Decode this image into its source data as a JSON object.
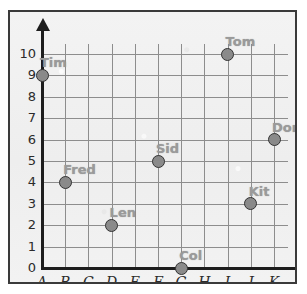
{
  "chart_data": {
    "type": "scatter",
    "title": "",
    "xlabel": "",
    "ylabel": "",
    "x_categories": [
      "A",
      "B",
      "C",
      "D",
      "E",
      "F",
      "G",
      "H",
      "I",
      "J",
      "K"
    ],
    "y_ticks": [
      "0",
      "1",
      "2",
      "3",
      "4",
      "5",
      "6",
      "7",
      "8",
      "9",
      "10"
    ],
    "ylim": [
      0,
      10
    ],
    "grid": true,
    "legend": "none",
    "points": [
      {
        "label": "Tim",
        "x": "A",
        "y": 9,
        "x_index": 0
      },
      {
        "label": "Fred",
        "x": "B",
        "y": 4,
        "x_index": 1
      },
      {
        "label": "Len",
        "x": "D",
        "y": 2,
        "x_index": 3
      },
      {
        "label": "Sid",
        "x": "F",
        "y": 5,
        "x_index": 5
      },
      {
        "label": "Col",
        "x": "G",
        "y": 0,
        "x_index": 6
      },
      {
        "label": "Tom",
        "x": "I",
        "y": 10,
        "x_index": 8
      },
      {
        "label": "Kit",
        "x": "J",
        "y": 3,
        "x_index": 9
      },
      {
        "label": "Don",
        "x": "K",
        "y": 6,
        "x_index": 10
      }
    ],
    "colors": {
      "point_fill": "#8a8a8a",
      "point_stroke": "#333333",
      "label_text": "#9a9a9a",
      "gridline": "#8d8d8d",
      "axis": "#1d1d1d",
      "background": "#f1f1f1",
      "frame": "#3a3a3a"
    }
  }
}
